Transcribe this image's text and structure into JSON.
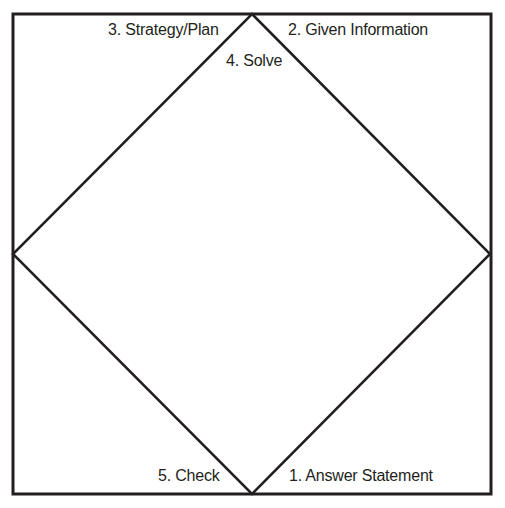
{
  "diagram": {
    "type": "four-corners-and-a-diamond",
    "frame": {
      "x": 13,
      "y": 14,
      "width": 478,
      "height": 480,
      "stroke": "#231f20",
      "stroke_width": 3
    },
    "diamond": {
      "top": [
        252,
        14
      ],
      "right": [
        490,
        254
      ],
      "bottom": [
        252,
        494
      ],
      "left": [
        13,
        254
      ],
      "stroke": "#231f20",
      "stroke_width": 2.5
    },
    "labels": {
      "given_information": "2. Given Information",
      "strategy_plan": "3. Strategy/Plan",
      "solve": "4. Solve",
      "check": "5. Check",
      "answer_statement": "1. Answer Statement"
    },
    "colors": {
      "background": "#ffffff",
      "ink": "#231f20"
    }
  }
}
